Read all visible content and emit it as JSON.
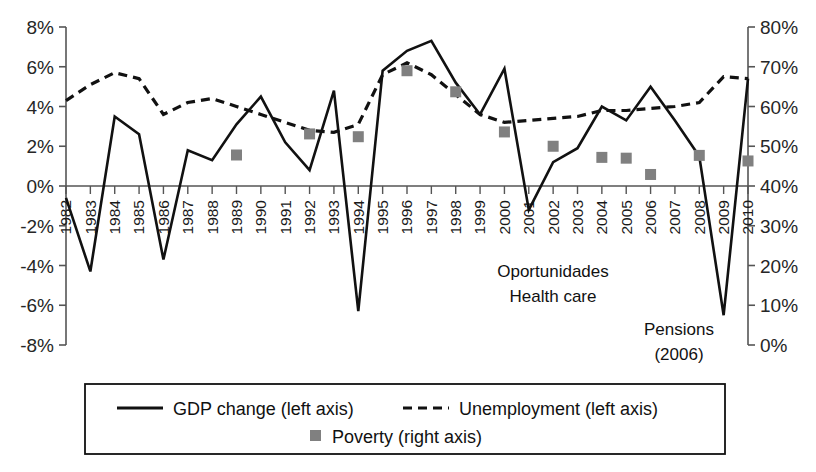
{
  "chart_data": {
    "type": "line",
    "title": "",
    "xlabel": "",
    "ylabel_left": "",
    "ylabel_right": "",
    "grid": false,
    "legend_position": "bottom",
    "x": [
      1982,
      1983,
      1984,
      1985,
      1986,
      1987,
      1988,
      1989,
      1990,
      1991,
      1992,
      1993,
      1994,
      1995,
      1996,
      1997,
      1998,
      1999,
      2000,
      2001,
      2002,
      2003,
      2004,
      2005,
      2006,
      2007,
      2008,
      2009,
      2010
    ],
    "left_axis": {
      "ticks": [
        "8%",
        "6%",
        "4%",
        "2%",
        "0%",
        "-2%",
        "-4%",
        "-6%",
        "-8%"
      ],
      "values": [
        8,
        6,
        4,
        2,
        0,
        -2,
        -4,
        -6,
        -8
      ],
      "lim": [
        -8,
        8
      ]
    },
    "right_axis": {
      "ticks": [
        "80%",
        "70%",
        "60%",
        "50%",
        "40%",
        "30%",
        "20%",
        "10%",
        "0%"
      ],
      "values": [
        80,
        70,
        60,
        50,
        40,
        30,
        20,
        10,
        0
      ],
      "lim": [
        0,
        80
      ]
    },
    "series": [
      {
        "name": "GDP change (left axis)",
        "key": "gdp",
        "axis": "left",
        "style": "solid",
        "color": "#111111",
        "values": [
          -0.6,
          -4.3,
          3.5,
          2.6,
          -3.7,
          1.8,
          1.3,
          3.1,
          4.5,
          2.2,
          0.8,
          4.8,
          -6.3,
          5.8,
          6.8,
          7.3,
          5.2,
          3.6,
          5.9,
          -1.2,
          1.2,
          1.9,
          4.0,
          3.3,
          5.0,
          3.3,
          1.5,
          -6.5,
          5.4
        ]
      },
      {
        "name": "Unemployment (left axis)",
        "key": "unemployment",
        "axis": "left",
        "style": "dashed",
        "color": "#111111",
        "values": [
          4.3,
          5.1,
          5.7,
          5.4,
          3.6,
          4.2,
          4.4,
          4.0,
          3.6,
          3.2,
          2.8,
          2.7,
          3.1,
          5.6,
          6.2,
          5.6,
          4.6,
          3.6,
          3.2,
          3.3,
          3.4,
          3.5,
          3.8,
          3.8,
          3.9,
          4.0,
          4.2,
          5.5,
          5.4
        ]
      },
      {
        "name": "Poverty (right axis)",
        "key": "poverty",
        "axis": "right",
        "style": "marker",
        "color": "#808080",
        "points": [
          {
            "year": 1989,
            "value": 47.8
          },
          {
            "year": 1992,
            "value": 53.1
          },
          {
            "year": 1994,
            "value": 52.4
          },
          {
            "year": 1996,
            "value": 69.0
          },
          {
            "year": 1998,
            "value": 63.7
          },
          {
            "year": 2000,
            "value": 53.6
          },
          {
            "year": 2002,
            "value": 50.0
          },
          {
            "year": 2004,
            "value": 47.2
          },
          {
            "year": 2005,
            "value": 47.0
          },
          {
            "year": 2006,
            "value": 42.9
          },
          {
            "year": 2008,
            "value": 47.7
          },
          {
            "year": 2010,
            "value": 46.3
          }
        ]
      }
    ],
    "annotations": [
      {
        "key": "oportunidades",
        "lines": [
          "Oportunidades",
          "Health care"
        ]
      },
      {
        "key": "pensions",
        "lines": [
          "Pensions",
          "(2006)"
        ]
      }
    ]
  },
  "legend": {
    "items": [
      {
        "key": "gdp",
        "label": "GDP change (left axis)",
        "marker": "solid-line"
      },
      {
        "key": "unemployment",
        "label": "Unemployment (left axis)",
        "marker": "dashed-line"
      },
      {
        "key": "poverty",
        "label": "Poverty (right axis)",
        "marker": "square"
      }
    ]
  },
  "annotation_text": {
    "oportunidades_line1": "Oportunidades",
    "oportunidades_line2": "Health care",
    "pensions_line1": "Pensions",
    "pensions_line2": "(2006)"
  },
  "colors": {
    "line": "#111111",
    "marker": "#808080",
    "axis": "#555555",
    "text": "#1a1a1a"
  }
}
